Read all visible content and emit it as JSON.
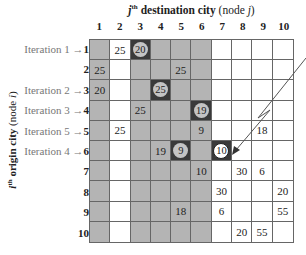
{
  "title": {
    "j": "j",
    "th": "th",
    "text": " destination city",
    "node": " (node ",
    "node_var": "j",
    "close": ")"
  },
  "y_label": {
    "i": "i",
    "th": "th",
    "text": " origin city",
    "node": " (node ",
    "node_var": "i",
    "close": ")"
  },
  "columns": [
    "1",
    "2",
    "3",
    "4",
    "5",
    "6",
    "7",
    "8",
    "9",
    "10"
  ],
  "rows": [
    {
      "prefix": "Iteration 1 →",
      "num": "1"
    },
    {
      "prefix": "",
      "num": "2"
    },
    {
      "prefix": "Iteration 2 →",
      "num": "3"
    },
    {
      "prefix": "Iteration 3 →",
      "num": "4"
    },
    {
      "prefix": "Iteration 5 →",
      "num": "5"
    },
    {
      "prefix": "Iteration 4 →",
      "num": "6"
    },
    {
      "prefix": "",
      "num": "7"
    },
    {
      "prefix": "",
      "num": "8"
    },
    {
      "prefix": "",
      "num": "9"
    },
    {
      "prefix": "",
      "num": "10"
    }
  ],
  "matrix": [
    [
      "",
      "25",
      "20",
      "",
      "",
      "",
      "",
      "",
      "",
      ""
    ],
    [
      "25",
      "",
      "",
      "",
      "25",
      "",
      "",
      "",
      "",
      ""
    ],
    [
      "20",
      "",
      "",
      "25",
      "",
      "",
      "",
      "",
      "",
      ""
    ],
    [
      "",
      "",
      "25",
      "",
      "",
      "19",
      "",
      "",
      "",
      ""
    ],
    [
      "",
      "25",
      "",
      "",
      "",
      "9",
      "",
      "",
      "18",
      ""
    ],
    [
      "",
      "",
      "",
      "19",
      "9",
      "",
      "10",
      "",
      "",
      ""
    ],
    [
      "",
      "",
      "",
      "",
      "",
      "10",
      "",
      "30",
      "6",
      ""
    ],
    [
      "",
      "",
      "",
      "",
      "",
      "",
      "30",
      "",
      "",
      "20"
    ],
    [
      "",
      "",
      "",
      "",
      "18",
      "",
      "6",
      "",
      "",
      "55"
    ],
    [
      "",
      "",
      "",
      "",
      "",
      "",
      "",
      "20",
      "55",
      ""
    ]
  ],
  "shading": [
    [
      "g",
      "w",
      "d",
      "g",
      "g",
      "g",
      "w",
      "w",
      "w",
      "w"
    ],
    [
      "g",
      "w",
      "g",
      "g",
      "g",
      "g",
      "w",
      "w",
      "w",
      "w"
    ],
    [
      "g",
      "w",
      "g",
      "d",
      "g",
      "g",
      "w",
      "w",
      "w",
      "w"
    ],
    [
      "g",
      "w",
      "g",
      "g",
      "g",
      "d",
      "w",
      "w",
      "w",
      "w"
    ],
    [
      "g",
      "w",
      "g",
      "g",
      "g",
      "g",
      "w",
      "w",
      "w",
      "w"
    ],
    [
      "g",
      "w",
      "g",
      "g",
      "d",
      "g",
      "d",
      "w",
      "w",
      "w"
    ],
    [
      "g",
      "w",
      "g",
      "g",
      "g",
      "g",
      "w",
      "w",
      "w",
      "w"
    ],
    [
      "g",
      "w",
      "g",
      "g",
      "g",
      "g",
      "w",
      "w",
      "w",
      "w"
    ],
    [
      "g",
      "w",
      "g",
      "g",
      "g",
      "g",
      "w",
      "w",
      "w",
      "w"
    ],
    [
      "g",
      "w",
      "g",
      "g",
      "g",
      "g",
      "w",
      "w",
      "w",
      "w"
    ]
  ],
  "circled": [
    {
      "row": 1,
      "col": 3,
      "value": "20",
      "style": "gray"
    },
    {
      "row": 3,
      "col": 4,
      "value": "25",
      "style": "gray"
    },
    {
      "row": 4,
      "col": 6,
      "value": "19",
      "style": "gray"
    },
    {
      "row": 6,
      "col": 5,
      "value": "9",
      "style": "gray"
    },
    {
      "row": 6,
      "col": 7,
      "value": "10",
      "style": "white"
    }
  ],
  "colors": {
    "shaded": "#b4b4b4",
    "selected": "#3a3a3a",
    "grid_line": "#666666"
  },
  "annotation": {
    "arrow": "zig-zag arrow pointing to circled 10 at row 6, column 7"
  }
}
